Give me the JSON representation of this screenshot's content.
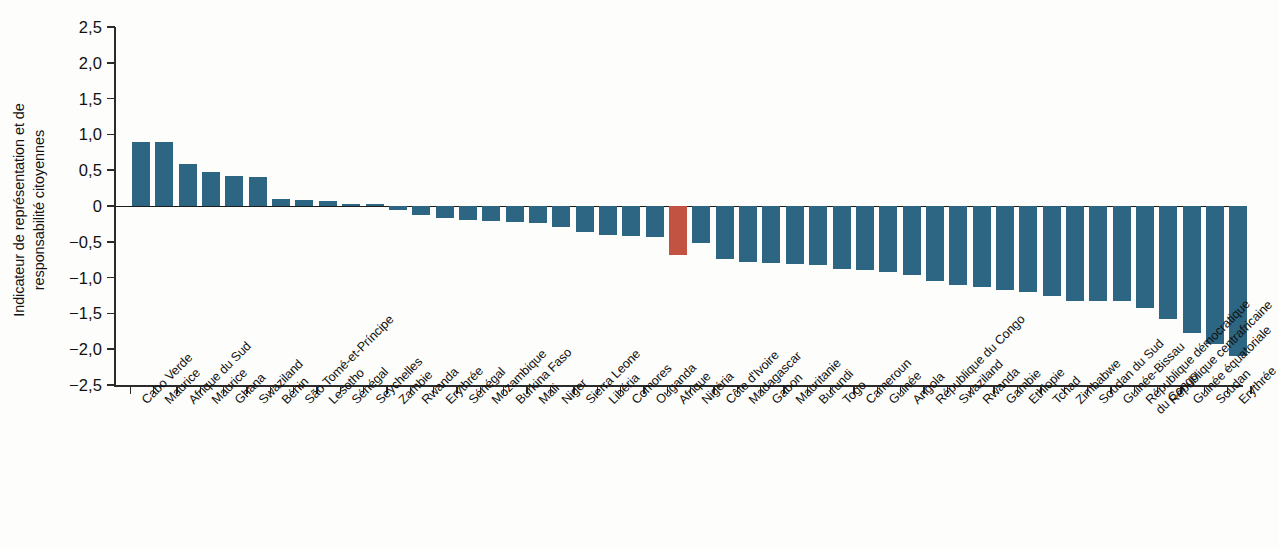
{
  "chart_data": {
    "type": "bar",
    "title": "",
    "subtitle": "",
    "xlabel": "",
    "ylabel": "Indicateur de représentation et de\nresponsabilité citoyennes",
    "ylim": [
      -2.5,
      2.5
    ],
    "ytick_labels": [
      "2,5",
      "2,0",
      "1,5",
      "1,0",
      "0,5",
      "0",
      "-0,5",
      "-1,0",
      "-1,5",
      "-2,0",
      "-2,5"
    ],
    "ytick_values": [
      2.5,
      2.0,
      1.5,
      1.0,
      0.5,
      0,
      -0.5,
      -1.0,
      -1.5,
      -2.0,
      -2.5
    ],
    "grid": false,
    "legend": "none",
    "bar_color": "#2d6682",
    "highlight_color": "#c25343",
    "highlight_category": "Afrique",
    "categories": [
      "Cabo Verde",
      "Maurice",
      "Afrique du Sud",
      "Maurice",
      "Ghana",
      "Swaziland",
      "Bénin",
      "São Tomé-et-Príncipe",
      "Lesotho",
      "Sénégal",
      "Seychelles",
      "Zambie",
      "Rwanda",
      "Erythrée",
      "Sénégal",
      "Mozambique",
      "Burkina Faso",
      "Mali",
      "Niger",
      "Sierra Leone",
      "Libéria",
      "Comores",
      "Ouganda",
      "Afrique",
      "Nigéria",
      "Côte d'Ivoire",
      "Madagascar",
      "Gabon",
      "Mauritanie",
      "Burundi",
      "Togo",
      "Cameroun",
      "Guinée",
      "Angola",
      "République du Congo",
      "Swaziland",
      "Rwanda",
      "Gambie",
      "Ethiopie",
      "Tchad",
      "Zimbabwe",
      "Soudan du Sud",
      "Guinée-Bissau",
      "République démocratique\ndu Congo",
      "République centrafricaine",
      "Guinée équatoriale",
      "Soudan",
      "Erythrée"
    ],
    "values": [
      0.9,
      0.9,
      0.59,
      0.47,
      0.42,
      0.4,
      0.1,
      0.09,
      0.07,
      0.02,
      0.0,
      -0.06,
      -0.12,
      -0.17,
      -0.19,
      -0.21,
      -0.22,
      -0.24,
      -0.3,
      -0.36,
      -0.4,
      -0.42,
      -0.43,
      -0.68,
      -0.52,
      -0.74,
      -0.78,
      -0.79,
      -0.81,
      -0.82,
      -0.88,
      -0.9,
      -0.92,
      -0.97,
      -1.05,
      -1.11,
      -1.13,
      -1.17,
      -1.2,
      -1.25,
      -1.32,
      -1.33,
      -1.33,
      -1.42,
      -1.58,
      -1.78,
      -1.93,
      -2.1
    ]
  }
}
